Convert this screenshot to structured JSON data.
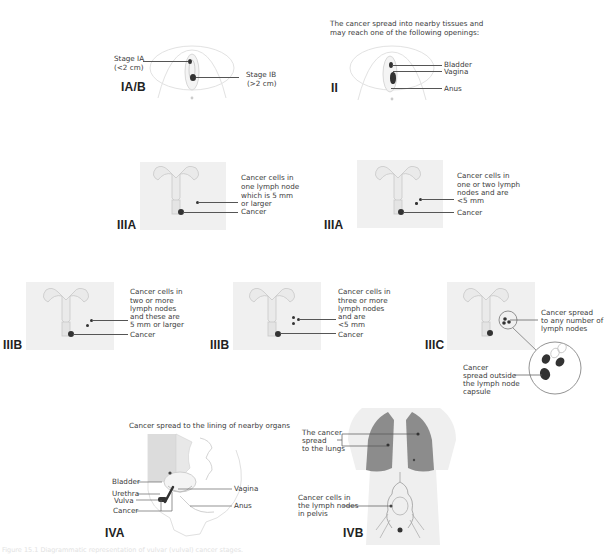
{
  "panels": {
    "ia_b": {
      "stage": "IA/B",
      "labels": [
        "Stage IA",
        "(<2 cm)",
        "Stage IB",
        "(>2 cm)"
      ]
    },
    "ii": {
      "stage": "II",
      "description": [
        "The cancer spread into nearby tissues and",
        "may reach one of the following openings:"
      ],
      "labels": [
        "Bladder",
        "Vagina",
        "Anus"
      ]
    },
    "iiia_1": {
      "stage": "IIIA",
      "labels": [
        "Cancer cells in",
        "one lymph node",
        "which is 5 mm",
        "or larger",
        "Cancer"
      ]
    },
    "iiia_2": {
      "stage": "IIIA",
      "labels": [
        "Cancer cells in",
        "one or two lymph",
        "nodes and are",
        "<5 mm",
        "Cancer"
      ]
    },
    "iiib_1": {
      "stage": "IIIB",
      "labels": [
        "Cancer cells in",
        "two or more",
        "lymph nodes",
        "and these are",
        "5 mm or larger",
        "Cancer"
      ]
    },
    "iiib_2": {
      "stage": "IIIB",
      "labels": [
        "Cancer cells in",
        "three or more",
        "lymph nodes",
        "and are",
        "<5 mm",
        "Cancer"
      ]
    },
    "iiic": {
      "stage": "IIIC",
      "labels": [
        "Cancer spread",
        "to any number of",
        "lymph nodes"
      ],
      "inset_labels": [
        "Cancer",
        "spread outside",
        "the lymph node",
        "capsule"
      ]
    },
    "iva": {
      "stage": "IVA",
      "description": "Cancer spread to the lining of nearby organs",
      "labels": [
        "Bladder",
        "Urethra",
        "Vulva",
        "Cancer",
        "Vagina",
        "Anus"
      ]
    },
    "ivb": {
      "stage": "IVB",
      "labels": [
        "The cancer",
        "spread",
        "to the lungs",
        "Cancer cells in",
        "the lymph nodes",
        "in pelvis"
      ]
    }
  },
  "caption": "Figure 15.1  Diagrammatic representation of vulvar (vulval) cancer stages.",
  "colors": {
    "tissue_bg": "#f0f0f0",
    "tumor": "#333333",
    "lung": "#8c8c8c",
    "outline": "#cccccc"
  }
}
